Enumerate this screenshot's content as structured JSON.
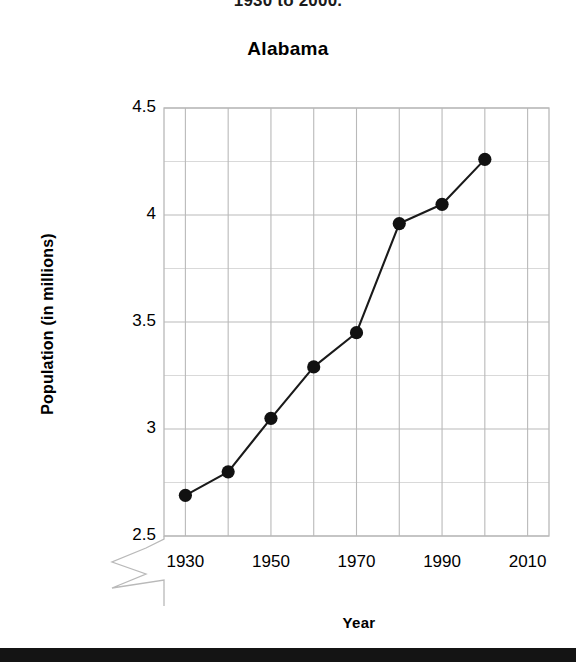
{
  "super_title": "1930 to 2000.",
  "chart": {
    "title": "Alabama",
    "x_axis_title": "Year",
    "y_axis_title": "Population (in millions)"
  },
  "chart_data": {
    "type": "line",
    "title": "Alabama",
    "xlabel": "Year",
    "ylabel": "Population (in millions)",
    "x": [
      1930,
      1940,
      1950,
      1960,
      1970,
      1980,
      1990,
      2000
    ],
    "values": [
      2.69,
      2.8,
      3.05,
      3.29,
      3.45,
      3.96,
      4.05,
      4.26
    ],
    "series": [
      {
        "name": "Alabama population",
        "values": [
          2.69,
          2.8,
          3.05,
          3.29,
          3.45,
          3.96,
          4.05,
          4.26
        ]
      }
    ],
    "xlim": [
      1925,
      2015
    ],
    "ylim": [
      2.5,
      4.5
    ],
    "x_tick_labels": [
      "1930",
      "1950",
      "1970",
      "1990",
      "2010"
    ],
    "x_ticks": [
      1930,
      1950,
      1970,
      1990,
      2010
    ],
    "y_tick_labels": [
      "2.5",
      "3",
      "3.5",
      "4",
      "4.5"
    ],
    "y_ticks": [
      2.5,
      3,
      3.5,
      4,
      4.5
    ],
    "y_axis_break": true,
    "y_axis_break_note": "zigzag break below 2.5",
    "grid": true,
    "legend": "none",
    "marker": "filled-circle",
    "marker_color": "#111111",
    "line_color": "#1a1a1a",
    "grid_color": "#b9b9b9"
  },
  "colors": {
    "line": "#1a1a1a",
    "marker": "#111111",
    "grid": "#b9b9b9",
    "text": "#000000",
    "bottom_bar": "#141414"
  }
}
